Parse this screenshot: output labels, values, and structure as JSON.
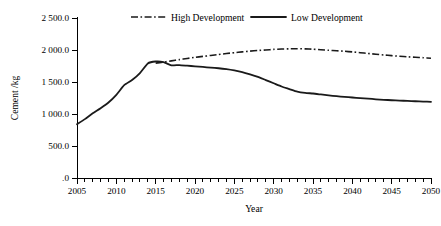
{
  "chart_data": {
    "type": "line",
    "title": "",
    "xlabel": "Year",
    "ylabel": "Cement /kg",
    "xlim": [
      2005,
      2050
    ],
    "ylim": [
      0,
      2500
    ],
    "grid": false,
    "legend_position": "top-center",
    "x_tick_labels": [
      "2005",
      "2010",
      "2015",
      "2020",
      "2025",
      "2030",
      "2035",
      "2040",
      "2045",
      "2050"
    ],
    "x_tick_values": [
      2005,
      2010,
      2015,
      2020,
      2025,
      2030,
      2035,
      2040,
      2045,
      2050
    ],
    "x_minor_tick_interval": 1,
    "y_tick_labels": [
      ".0",
      "500.0",
      "1 000.0",
      "1 500.0",
      "2 000.0",
      "2 500.0"
    ],
    "y_tick_values": [
      0,
      500,
      1000,
      1500,
      2000,
      2500
    ],
    "series": [
      {
        "name": "High Development",
        "style": "dash-dot",
        "color": "#1a1a1a",
        "x": [
          2015,
          2016,
          2017,
          2018,
          2019,
          2020,
          2021,
          2022,
          2023,
          2024,
          2025,
          2026,
          2027,
          2028,
          2029,
          2030,
          2031,
          2032,
          2033,
          2034,
          2035,
          2036,
          2037,
          2038,
          2039,
          2040,
          2041,
          2042,
          2043,
          2044,
          2045,
          2046,
          2047,
          2048,
          2049,
          2050
        ],
        "values": [
          1795,
          1810,
          1830,
          1850,
          1868,
          1885,
          1900,
          1915,
          1930,
          1945,
          1958,
          1970,
          1982,
          1992,
          2000,
          2010,
          2015,
          2018,
          2020,
          2018,
          2012,
          2004,
          1996,
          1988,
          1980,
          1970,
          1958,
          1946,
          1934,
          1922,
          1912,
          1902,
          1894,
          1886,
          1880,
          1872
        ]
      },
      {
        "name": "Low Development",
        "style": "solid",
        "color": "#1a1a1a",
        "x": [
          2005,
          2006,
          2007,
          2008,
          2009,
          2010,
          2011,
          2012,
          2013,
          2014,
          2015,
          2016,
          2017,
          2018,
          2019,
          2020,
          2021,
          2022,
          2023,
          2024,
          2025,
          2026,
          2027,
          2028,
          2029,
          2030,
          2031,
          2032,
          2033,
          2034,
          2035,
          2036,
          2037,
          2038,
          2039,
          2040,
          2041,
          2042,
          2043,
          2044,
          2045,
          2046,
          2047,
          2048,
          2049,
          2050
        ],
        "values": [
          840,
          920,
          1010,
          1090,
          1180,
          1300,
          1450,
          1530,
          1640,
          1790,
          1820,
          1810,
          1760,
          1765,
          1755,
          1745,
          1735,
          1725,
          1715,
          1700,
          1680,
          1655,
          1620,
          1580,
          1530,
          1480,
          1430,
          1390,
          1350,
          1330,
          1320,
          1305,
          1290,
          1278,
          1268,
          1258,
          1248,
          1240,
          1230,
          1222,
          1215,
          1210,
          1204,
          1199,
          1194,
          1190
        ]
      }
    ],
    "legend": [
      {
        "label": "High Development",
        "style": "dash-dot"
      },
      {
        "label": "Low Development",
        "style": "solid"
      }
    ]
  }
}
